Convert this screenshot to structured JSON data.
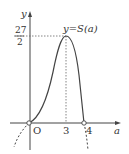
{
  "graph": {
    "y_axis_label": "y",
    "x_axis_label": "a",
    "origin_label": "O",
    "curve_label": "y=S(a)",
    "peak_numerator": "27",
    "peak_denominator": "2",
    "x_ticks": [
      "3",
      "4"
    ],
    "colors": {
      "curve": "#444444",
      "axis": "#444444",
      "dashed": "#666666"
    }
  }
}
